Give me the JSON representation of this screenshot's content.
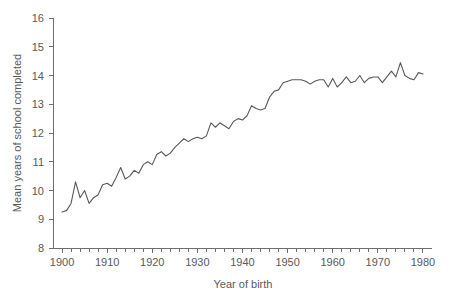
{
  "chart_data": {
    "type": "line",
    "title": "",
    "xlabel": "Year of birth",
    "ylabel": "Mean years of school completed",
    "xlim": [
      1898,
      1982
    ],
    "ylim": [
      8,
      16
    ],
    "grid": false,
    "legend": "none",
    "line_color": "#58595b",
    "axis_color": "#6d6e71",
    "xticks_major": [
      1900,
      1910,
      1920,
      1930,
      1940,
      1950,
      1960,
      1970,
      1980
    ],
    "xtick_labels": [
      "1900",
      "1910",
      "1920",
      "1930",
      "1940",
      "1950",
      "1960",
      "1970",
      "1980"
    ],
    "xtick_minor_step": 2,
    "yticks": [
      8,
      9,
      10,
      11,
      12,
      13,
      14,
      15,
      16
    ],
    "ytick_labels": [
      "8",
      "9",
      "10",
      "11",
      "12",
      "13",
      "14",
      "15",
      "16"
    ],
    "x": [
      1900,
      1901,
      1902,
      1903,
      1904,
      1905,
      1906,
      1907,
      1908,
      1909,
      1910,
      1911,
      1912,
      1913,
      1914,
      1915,
      1916,
      1917,
      1918,
      1919,
      1920,
      1921,
      1922,
      1923,
      1924,
      1925,
      1926,
      1927,
      1928,
      1929,
      1930,
      1931,
      1932,
      1933,
      1934,
      1935,
      1936,
      1937,
      1938,
      1939,
      1940,
      1941,
      1942,
      1943,
      1944,
      1945,
      1946,
      1947,
      1948,
      1949,
      1950,
      1951,
      1952,
      1953,
      1954,
      1955,
      1956,
      1957,
      1958,
      1959,
      1960,
      1961,
      1962,
      1963,
      1964,
      1965,
      1966,
      1967,
      1968,
      1969,
      1970,
      1971,
      1972,
      1973,
      1974,
      1975,
      1976,
      1977,
      1978,
      1979,
      1980
    ],
    "values": [
      9.25,
      9.3,
      9.55,
      10.3,
      9.75,
      10.0,
      9.55,
      9.75,
      9.85,
      10.2,
      10.25,
      10.15,
      10.45,
      10.8,
      10.4,
      10.5,
      10.7,
      10.6,
      10.9,
      11.0,
      10.9,
      11.25,
      11.35,
      11.2,
      11.3,
      11.5,
      11.65,
      11.8,
      11.7,
      11.8,
      11.85,
      11.8,
      11.9,
      12.35,
      12.2,
      12.35,
      12.25,
      12.15,
      12.4,
      12.5,
      12.45,
      12.6,
      12.95,
      12.85,
      12.8,
      12.85,
      13.25,
      13.45,
      13.5,
      13.75,
      13.8,
      13.85,
      13.85,
      13.85,
      13.8,
      13.7,
      13.8,
      13.85,
      13.85,
      13.6,
      13.9,
      13.6,
      13.75,
      13.95,
      13.75,
      13.8,
      14.0,
      13.75,
      13.9,
      13.95,
      13.95,
      13.75,
      13.95,
      14.15,
      13.95,
      14.45,
      14.0,
      13.9,
      13.85,
      14.1,
      14.05
    ]
  }
}
